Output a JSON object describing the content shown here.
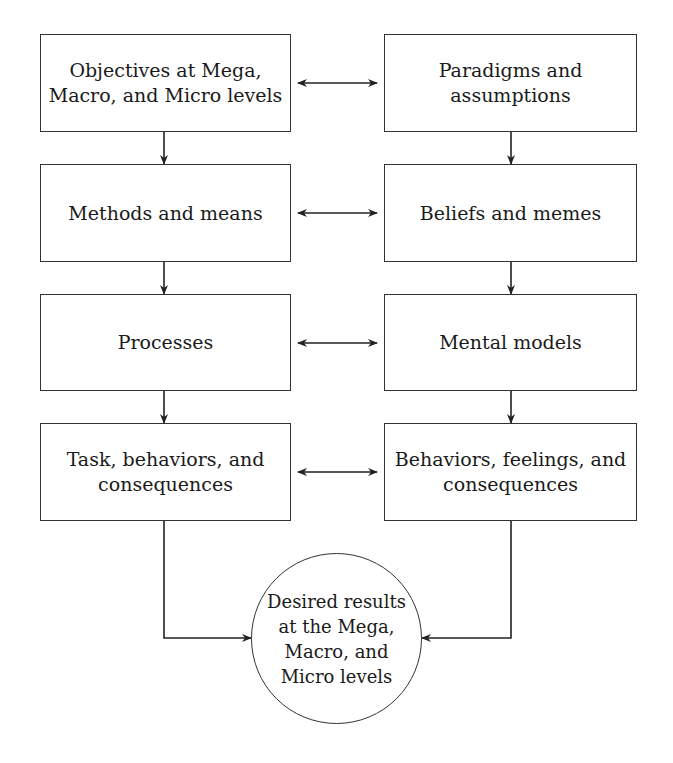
{
  "diagram": {
    "left_column": [
      {
        "label": "Objectives at Mega, Macro, and Micro levels"
      },
      {
        "label": "Methods and means"
      },
      {
        "label": "Processes"
      },
      {
        "label": "Task, behaviors, and consequences"
      }
    ],
    "right_column": [
      {
        "label": "Paradigms and assumptions"
      },
      {
        "label": "Beliefs and memes"
      },
      {
        "label": "Mental models"
      },
      {
        "label": "Behaviors, feelings, and consequences"
      }
    ],
    "result": {
      "label": "Desired results at the Mega, Macro, and Micro levels"
    },
    "connectors": {
      "horizontal": "bidirectional arrows between each left and right box",
      "vertical": "downward arrows between boxes in each column",
      "final": "both columns converge into the result circle"
    }
  }
}
